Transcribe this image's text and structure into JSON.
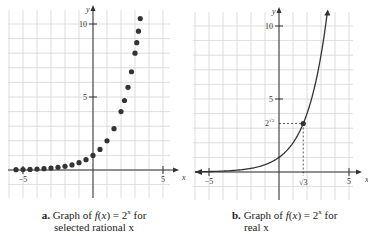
{
  "chart_data": [
    {
      "type": "scatter",
      "panel": "a",
      "caption_label": "a.",
      "caption_line1": "Graph of f(x) = 2",
      "caption_sup": "x",
      "caption_tail": " for",
      "caption_line2": "selected rational x",
      "title": "a. Graph of f(x) = 2^x for selected rational x",
      "xlabel": "x",
      "ylabel": "y",
      "xlim": [
        -6,
        6
      ],
      "ylim": [
        -2,
        11
      ],
      "x_ticks": [
        -5,
        5
      ],
      "y_ticks": [
        5,
        10
      ],
      "grid": true,
      "x": [
        -5.5,
        -5,
        -4.5,
        -4,
        -3.5,
        -3,
        -2.5,
        -2,
        -1.5,
        -1,
        -0.5,
        0,
        0.5,
        1,
        1.5,
        2,
        2.25,
        2.5,
        2.75,
        3,
        3.125,
        3.25,
        3.375,
        3.5
      ],
      "values": [
        0.02,
        0.03,
        0.04,
        0.06,
        0.09,
        0.13,
        0.18,
        0.25,
        0.35,
        0.5,
        0.71,
        1,
        1.41,
        2,
        2.83,
        4,
        4.76,
        5.66,
        6.73,
        8,
        8.72,
        9.51,
        10.37,
        11.31
      ]
    },
    {
      "type": "line",
      "panel": "b",
      "caption_label": "b.",
      "caption_line1": "Graph of f(x) = 2",
      "caption_sup": "x",
      "caption_tail": " for",
      "caption_line2": "real x",
      "title": "b. Graph of f(x) = 2^x for real x",
      "xlabel": "x",
      "ylabel": "y",
      "xlim": [
        -6,
        6
      ],
      "ylim": [
        -2,
        11
      ],
      "x_ticks": [
        -5,
        5
      ],
      "y_ticks": [
        5,
        10
      ],
      "grid": true,
      "annotations": [
        {
          "point": [
            1.732,
            3.32
          ],
          "x_label": "√3",
          "y_label": "2^√3",
          "dashed_guides": true
        }
      ],
      "function": "2^x"
    }
  ],
  "labels": {
    "tick_neg5": "−5",
    "tick_5": "5",
    "tick_10": "10",
    "axis_x": "x",
    "axis_y": "y",
    "sqrt3": "√3",
    "two_pow_sqrt3": "2",
    "sqrt_sup": "√3"
  }
}
